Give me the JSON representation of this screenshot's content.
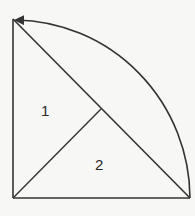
{
  "diagram": {
    "labels": {
      "region1": "1",
      "region2": "2"
    },
    "colors": {
      "stroke": "#333333",
      "background": "#f7f7f5"
    }
  }
}
